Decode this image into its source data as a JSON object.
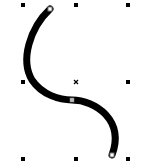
{
  "canvas": {
    "background": "#ffffff",
    "selected_object": {
      "type": "curve",
      "stroke_color": "#000000",
      "stroke_width": 7
    },
    "selection_handles": [
      {
        "name": "top-left",
        "x": 23,
        "y": 5
      },
      {
        "name": "top-center",
        "x": 76,
        "y": 5
      },
      {
        "name": "top-right",
        "x": 128,
        "y": 5
      },
      {
        "name": "middle-left",
        "x": 23,
        "y": 82
      },
      {
        "name": "middle-right",
        "x": 128,
        "y": 82
      },
      {
        "name": "bottom-left",
        "x": 23,
        "y": 159
      },
      {
        "name": "bottom-center",
        "x": 76,
        "y": 159
      },
      {
        "name": "bottom-right",
        "x": 128,
        "y": 159
      }
    ],
    "center_marker": {
      "x": 76,
      "y": 82,
      "glyph": "×"
    },
    "nodes": [
      {
        "name": "start-node",
        "x": 50,
        "y": 9
      },
      {
        "name": "mid-node",
        "x": 72,
        "y": 100
      },
      {
        "name": "end-node",
        "x": 112,
        "y": 155
      }
    ]
  }
}
